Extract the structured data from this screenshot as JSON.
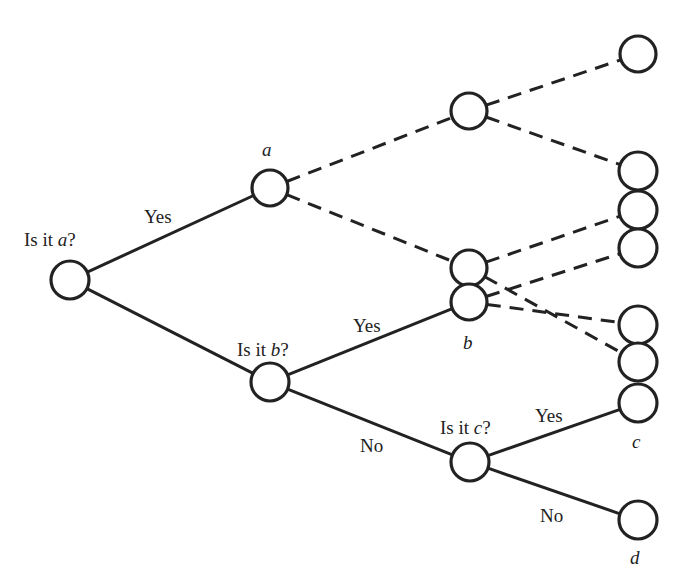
{
  "diagram": {
    "type": "decision-tree",
    "colors": {
      "stroke": "#222222",
      "background": "#ffffff"
    },
    "nodes": [
      {
        "id": "root",
        "x": 70,
        "y": 280,
        "r": 19
      },
      {
        "id": "a",
        "x": 270,
        "y": 188,
        "r": 18
      },
      {
        "id": "isb",
        "x": 270,
        "y": 382,
        "r": 19
      },
      {
        "id": "m1",
        "x": 469,
        "y": 111,
        "r": 18
      },
      {
        "id": "m2",
        "x": 469,
        "y": 268,
        "r": 18
      },
      {
        "id": "b",
        "x": 469,
        "y": 302,
        "r": 18
      },
      {
        "id": "isc",
        "x": 470,
        "y": 462,
        "r": 19
      },
      {
        "id": "r1",
        "x": 638,
        "y": 54,
        "r": 18
      },
      {
        "id": "r2",
        "x": 638,
        "y": 171,
        "r": 19
      },
      {
        "id": "r3",
        "x": 638,
        "y": 210,
        "r": 19
      },
      {
        "id": "r4",
        "x": 638,
        "y": 248,
        "r": 19
      },
      {
        "id": "r5",
        "x": 638,
        "y": 325,
        "r": 19
      },
      {
        "id": "r6",
        "x": 638,
        "y": 362,
        "r": 19
      },
      {
        "id": "c",
        "x": 638,
        "y": 403,
        "r": 19
      },
      {
        "id": "d",
        "x": 638,
        "y": 520,
        "r": 19
      }
    ],
    "edges": [
      {
        "from": "root",
        "to": "a",
        "style": "solid"
      },
      {
        "from": "root",
        "to": "isb",
        "style": "solid"
      },
      {
        "from": "a",
        "to": "m1",
        "style": "dashed"
      },
      {
        "from": "a",
        "to": "m2",
        "style": "dashed"
      },
      {
        "from": "m1",
        "to": "r1",
        "style": "dashed"
      },
      {
        "from": "m1",
        "to": "r2",
        "style": "dashed"
      },
      {
        "from": "isb",
        "to": "b",
        "style": "solid"
      },
      {
        "from": "isb",
        "to": "isc",
        "style": "solid"
      },
      {
        "from": "m2",
        "to": "r3",
        "style": "dashed"
      },
      {
        "from": "m2",
        "to": "r6",
        "style": "dashed"
      },
      {
        "from": "b",
        "to": "r4",
        "style": "dashed"
      },
      {
        "from": "b",
        "to": "r5",
        "style": "dashed"
      },
      {
        "from": "isc",
        "to": "c",
        "style": "solid"
      },
      {
        "from": "isc",
        "to": "d",
        "style": "solid"
      }
    ],
    "labels": {
      "q_a_prefix": "Is it ",
      "q_a_var": "a",
      "q_a_suffix": "?",
      "q_b_prefix": "Is it ",
      "q_b_var": "b",
      "q_b_suffix": "?",
      "q_c_prefix": "Is it ",
      "q_c_var": "c",
      "q_c_suffix": "?",
      "yes_1": "Yes",
      "yes_2": "Yes",
      "yes_3": "Yes",
      "no_1": "No",
      "no_2": "No",
      "leaf_a": "a",
      "leaf_b": "b",
      "leaf_c": "c",
      "leaf_d": "d"
    }
  }
}
